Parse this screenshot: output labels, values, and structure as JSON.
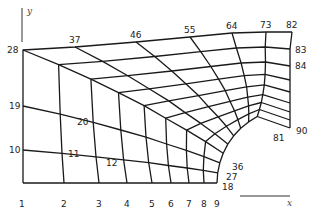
{
  "diagram": {
    "title": "",
    "axes": {
      "x_label": "x",
      "y_label": "y",
      "x_axis": {
        "x1": 240,
        "y1": 196,
        "x2": 290,
        "y2": 196
      },
      "x_label_pos": [
        287,
        206
      ],
      "y_axis": {
        "x1": 22,
        "y1": 8,
        "x2": 22,
        "y2": 42
      },
      "y_label_pos": [
        27,
        14
      ]
    },
    "grid": {
      "cols": 9,
      "rows": 10
    },
    "boundary": {
      "bottom": [
        [
          23,
          183
        ],
        [
          64,
          183
        ],
        [
          99,
          183
        ],
        [
          127,
          183
        ],
        [
          152,
          183
        ],
        [
          171,
          183
        ],
        [
          189,
          183
        ],
        [
          204,
          183
        ],
        [
          217,
          183
        ]
      ],
      "left": [
        [
          23,
          183
        ],
        [
          23,
          150
        ],
        [
          23,
          106
        ],
        [
          23,
          50
        ]
      ],
      "top": [
        [
          23,
          50
        ],
        [
          75,
          47
        ],
        [
          136,
          42
        ],
        [
          190,
          37
        ],
        [
          232,
          33
        ],
        [
          266,
          32
        ],
        [
          292,
          32
        ]
      ],
      "right": [
        [
          292,
          32
        ],
        [
          292,
          49
        ],
        [
          292,
          66
        ],
        [
          292,
          80
        ],
        [
          292,
          92
        ],
        [
          292,
          103
        ],
        [
          292,
          112
        ],
        [
          292,
          120
        ],
        [
          292,
          128
        ]
      ],
      "inner_arc_center": [
        292,
        183
      ],
      "inner_arc_radius": 75
    },
    "node_labels": [
      {
        "text": "1",
        "x": 19,
        "y": 207
      },
      {
        "text": "2",
        "x": 61,
        "y": 207
      },
      {
        "text": "3",
        "x": 96,
        "y": 207
      },
      {
        "text": "4",
        "x": 124,
        "y": 207
      },
      {
        "text": "5",
        "x": 149,
        "y": 207
      },
      {
        "text": "6",
        "x": 168,
        "y": 207
      },
      {
        "text": "7",
        "x": 186,
        "y": 207
      },
      {
        "text": "8",
        "x": 201,
        "y": 207
      },
      {
        "text": "9",
        "x": 214,
        "y": 207
      },
      {
        "text": "10",
        "x": 9,
        "y": 153
      },
      {
        "text": "19",
        "x": 9,
        "y": 109
      },
      {
        "text": "28",
        "x": 7,
        "y": 53
      },
      {
        "text": "37",
        "x": 69,
        "y": 43
      },
      {
        "text": "46",
        "x": 130,
        "y": 38
      },
      {
        "text": "55",
        "x": 184,
        "y": 33
      },
      {
        "text": "64",
        "x": 226,
        "y": 29
      },
      {
        "text": "73",
        "x": 260,
        "y": 28
      },
      {
        "text": "82",
        "x": 286,
        "y": 28
      },
      {
        "text": "83",
        "x": 295,
        "y": 53
      },
      {
        "text": "84",
        "x": 295,
        "y": 69
      },
      {
        "text": "90",
        "x": 296,
        "y": 134
      },
      {
        "text": "81",
        "x": 273,
        "y": 141
      },
      {
        "text": "11",
        "x": 68,
        "y": 157
      },
      {
        "text": "12",
        "x": 106,
        "y": 166
      },
      {
        "text": "20",
        "x": 77,
        "y": 125
      },
      {
        "text": "36",
        "x": 232,
        "y": 170
      },
      {
        "text": "27",
        "x": 226,
        "y": 180
      },
      {
        "text": "18",
        "x": 222,
        "y": 190
      }
    ]
  }
}
